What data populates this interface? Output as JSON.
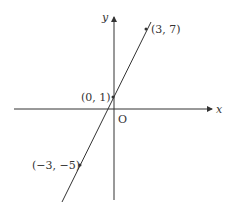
{
  "diagram": {
    "type": "coordinate-plane-line",
    "axes": {
      "x_label": "x",
      "y_label": "y",
      "origin_label": "O"
    },
    "line": {
      "equation": "y = 2x + 1",
      "color": "#333333"
    },
    "points": [
      {
        "label": "(3, 7)",
        "x": 3,
        "y": 7
      },
      {
        "label": "(0, 1)",
        "x": 0,
        "y": 1
      },
      {
        "label": "(−3, −5)",
        "x": -3,
        "y": -5
      }
    ]
  }
}
